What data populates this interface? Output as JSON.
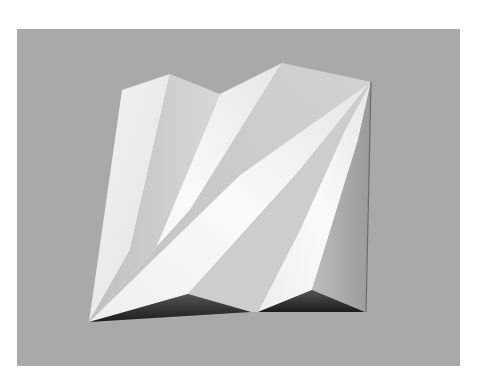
{
  "image": {
    "subject": "folded paper relief sculpture",
    "background_color": "#a9a9a9",
    "frame_color": "#ffffff",
    "palette": {
      "highlight": "#f7f7f7",
      "light": "#e4e4e4",
      "mid": "#cfcfcf",
      "midshade": "#bdbdbd",
      "shade": "#a3a3a3",
      "dark": "#4a4a4a",
      "darkest": "#1e1e1e"
    }
  }
}
